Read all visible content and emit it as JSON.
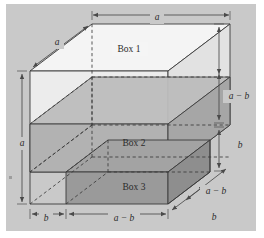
{
  "figure": {
    "type": "geometric-diagram",
    "background_color": "#c9c9c9",
    "page_color": "#ffffff",
    "stroke_color": "#3a3a3a",
    "dim_color": "#4a4a4a",
    "box_labels": [
      {
        "id": "box-1",
        "text": "Box 1",
        "x": 129,
        "y": 50,
        "fill": "#f2f2f2"
      },
      {
        "id": "box-2",
        "text": "Box 2",
        "x": 134,
        "y": 144,
        "fill": "#b4b4b4"
      },
      {
        "id": "box-3",
        "text": "Box 3",
        "x": 134,
        "y": 188,
        "fill": "#a0a0a0"
      }
    ],
    "dimensions": [
      {
        "id": "dim-top-a",
        "text": "a",
        "x": 157,
        "y": 19
      },
      {
        "id": "dim-depth-a",
        "text": "a",
        "x": 57,
        "y": 44
      },
      {
        "id": "dim-left-a",
        "text": "a",
        "x": 22,
        "y": 144
      },
      {
        "id": "dim-right-a-b",
        "text": "a − b",
        "x": 238,
        "y": 97
      },
      {
        "id": "dim-right-b",
        "text": "b",
        "x": 240,
        "y": 146
      },
      {
        "id": "dim-bottom-b",
        "text": "b",
        "x": 46,
        "y": 219
      },
      {
        "id": "dim-bottom-a-b",
        "text": "a − b",
        "x": 124,
        "y": 219
      },
      {
        "id": "dim-depth-b",
        "text": "b",
        "x": 214,
        "y": 218
      },
      {
        "id": "dim-depth-a-b",
        "text": "a − b",
        "x": 216,
        "y": 192
      }
    ]
  }
}
